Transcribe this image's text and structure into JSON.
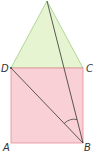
{
  "diagram": {
    "points": {
      "A": {
        "label": "A",
        "x": 11,
        "y": 143
      },
      "B": {
        "label": "B",
        "x": 83,
        "y": 143
      },
      "C": {
        "label": "C",
        "x": 83,
        "y": 68
      },
      "D": {
        "label": "D",
        "x": 11,
        "y": 68
      },
      "E": {
        "label": "",
        "x": 47,
        "y": 1
      }
    },
    "segments": [
      "DB",
      "EB"
    ],
    "angle_mark": "DBE",
    "colors": {
      "square_fill": "#f9d0d6",
      "square_stroke": "#e58a97",
      "triangle_fill": "#e6f4d2",
      "triangle_stroke": "#9ccf84",
      "line": "#333333"
    }
  }
}
